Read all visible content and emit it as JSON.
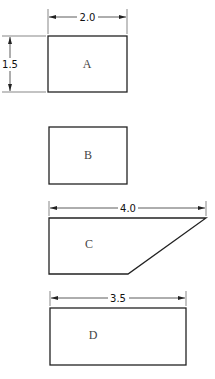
{
  "diagram": {
    "type": "engineering-dimensioned-shapes",
    "shapes": [
      {
        "label": "A",
        "kind": "rectangle",
        "width_dim": "2.0",
        "height_dim": "1.5"
      },
      {
        "label": "B",
        "kind": "rectangle"
      },
      {
        "label": "C",
        "kind": "trapezoid",
        "width_dim": "4.0"
      },
      {
        "label": "D",
        "kind": "rectangle",
        "width_dim": "3.5"
      }
    ]
  }
}
